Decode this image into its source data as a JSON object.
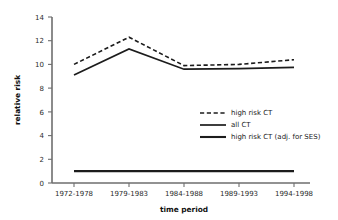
{
  "chart_data": {
    "type": "line",
    "title": "",
    "xlabel": "time period",
    "ylabel": "relative risk",
    "categories": [
      "1972-1978",
      "1979-1983",
      "1984-1988",
      "1989-1993",
      "1994-1998"
    ],
    "ylim": [
      0,
      14
    ],
    "yticks": [
      0,
      2,
      4,
      6,
      8,
      10,
      12,
      14
    ],
    "grid": false,
    "legend_position": "center-right",
    "series": [
      {
        "name": "high risk CT",
        "style": "dashed",
        "values": [
          10.0,
          12.3,
          9.9,
          10.0,
          10.4
        ]
      },
      {
        "name": "all CT",
        "style": "solid",
        "values": [
          9.1,
          11.3,
          9.6,
          9.65,
          9.75
        ]
      },
      {
        "name": "high risk CT (adj. for SES)",
        "style": "solid-thick",
        "values": [
          1.0,
          1.0,
          1.0,
          1.0,
          1.0
        ]
      }
    ]
  },
  "axis": {
    "y_tick_labels": [
      "0",
      "2",
      "4",
      "6",
      "8",
      "10",
      "12",
      "14"
    ],
    "x_tick_labels": [
      "1972-1978",
      "1979-1983",
      "1984-1988",
      "1989-1993",
      "1994-1998"
    ],
    "y_title": "relative risk",
    "x_title": "time period"
  },
  "legend": {
    "entries": [
      {
        "label": "high risk CT"
      },
      {
        "label": "all CT"
      },
      {
        "label": "high risk CT (adj. for SES)"
      }
    ]
  },
  "colors": {
    "line": "#1c1c1c",
    "axis": "#6e6e6e",
    "text": "#1a1a1a",
    "background": "#ffffff"
  }
}
